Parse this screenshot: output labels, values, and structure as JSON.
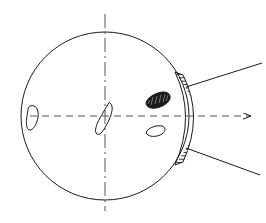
{
  "figure": {
    "canvas": {
      "width": 266,
      "height": 223,
      "background": "#ffffff"
    },
    "style": {
      "stroke": "#1a1a1a",
      "fill_dark": "#1a1a1a",
      "fill_none": "none",
      "stroke_width": 1.0,
      "axis_stroke_width": 1.0,
      "hatch_stroke_width": 0.9
    },
    "globe": {
      "name": "eyeball-outline",
      "shape": "circle",
      "cx": 105,
      "cy": 116,
      "r": 84
    },
    "cornea_band": {
      "name": "hatched-cornea-band",
      "description": "hatched arc band at the anterior pole",
      "inner_arc": "M 175 72 Q 196 116 175 165",
      "outer_arc": "M 183 75 Q 204 116 183 162",
      "hatch_line_count": 28,
      "hatch_angle_deg": 0
    },
    "axes": {
      "horizontal": {
        "name": "optical-axis-horizontal",
        "style": "dashed",
        "x1": 30,
        "y1": 116,
        "x2": 252,
        "y2": 116,
        "dash": "7,5",
        "arrowhead": true
      },
      "vertical": {
        "name": "axis-vertical",
        "style": "dash-dot",
        "x1": 105,
        "y1": 14,
        "x2": 105,
        "y2": 211,
        "dash": "14,4,2,4",
        "arrowhead": false
      }
    },
    "rays": [
      {
        "name": "ray-upper",
        "x1": 186,
        "y1": 87,
        "x2": 262,
        "y2": 63
      },
      {
        "name": "ray-lower",
        "x1": 186,
        "y1": 148,
        "x2": 260,
        "y2": 175
      }
    ],
    "structures": [
      {
        "name": "posterior-blob-left",
        "label": "left teardrop structure",
        "fill": "none",
        "path": "M 30 106 C 36 104 39 110 38 117 C 37 124 33 131 29 130 C 26 129 26 122 27 116 C 28 110 28 107 30 106 Z"
      },
      {
        "name": "lens-center-blob",
        "label": "central lens/teardrop structure",
        "fill": "none",
        "path": "M 110 103 C 114 106 112 114 108 122 C 104 130 100 136 97 134 C 94 132 96 125 100 118 C 104 111 107 106 108 104 C 109 102 109 102 110 103 Z"
      },
      {
        "name": "dark-textured-blob",
        "label": "dark elongated pigmented body",
        "fill": "#1a1a1a",
        "path": "M 146 104 C 146 99 152 95 158 93 C 164 91 169 92 170 96 C 171 100 166 105 160 107 C 154 109 148 109 146 104 Z",
        "angle_deg": -22
      },
      {
        "name": "small-crescent-blob",
        "label": "small crescent structure below axis",
        "fill": "none",
        "path": "M 147 131 C 150 127 157 125 162 126 C 166 127 166 131 162 134 C 157 137 151 137 148 135 C 146 134 146 132 147 131 Z"
      }
    ]
  }
}
